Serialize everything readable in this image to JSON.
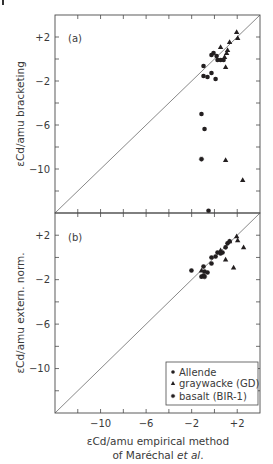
{
  "chart_data": [
    {
      "panel": "(a)",
      "type": "scatter",
      "ylabel": "εCd/amu bracketing",
      "xlabel": "εCd/amu empirical method of Maréchal et al.",
      "xlim": [
        -14,
        4
      ],
      "ylim": [
        -14,
        4
      ],
      "xticks": [
        -10,
        -6,
        -2,
        2
      ],
      "xtick_labels": [
        "−10",
        "−6",
        "−2",
        "+2"
      ],
      "yticks": [
        2,
        -2,
        -6,
        -10
      ],
      "ytick_labels": [
        "+2",
        "−2",
        "−6",
        "−10"
      ],
      "minor_tick_step": 2,
      "reference_line": "1:1",
      "series": [
        {
          "name": "Allende",
          "marker": "circle",
          "x": [
            -0.96,
            -0.96,
            -0.61,
            -0.26,
            0.1,
            -0.26,
            -0.08,
            0.19,
            0.27,
            0.54,
            0.8,
            -1.14,
            -0.87,
            -0.52
          ],
          "y": [
            -0.64,
            -1.55,
            -1.64,
            -1.27,
            -1.82,
            0.36,
            0.55,
            0.27,
            -0.09,
            -0.09,
            -0.09,
            -5.0,
            -6.36,
            -13.8
          ]
        },
        {
          "name": "graywacke (GD)",
          "marker": "triangle",
          "x": [
            1.95,
            2.04,
            1.33,
            0.54,
            0.98,
            0.98,
            2.48,
            1.15,
            1.07,
            0.89
          ],
          "y": [
            2.45,
            1.9,
            1.55,
            1.09,
            -0.73,
            -9.18,
            -11.0,
            0.82,
            0.55,
            0.18
          ]
        },
        {
          "name": "basalt (BIR-1)",
          "marker": "star-dot",
          "x": [
            -1.14
          ],
          "y": [
            -9.1
          ]
        }
      ]
    },
    {
      "panel": "(b)",
      "type": "scatter",
      "ylabel": "εCd/amu extern. norm.",
      "xlabel": "εCd/amu empirical method of Maréchal et al.",
      "xlim": [
        -14,
        4
      ],
      "ylim": [
        -14,
        4
      ],
      "xticks": [
        -10,
        -6,
        -2,
        2
      ],
      "xtick_labels": [
        "−10",
        "−6",
        "−2",
        "+2"
      ],
      "yticks": [
        2,
        -2,
        -6,
        -10
      ],
      "ytick_labels": [
        "+2",
        "−2",
        "−6",
        "−10"
      ],
      "minor_tick_step": 2,
      "reference_line": "1:1",
      "series": [
        {
          "name": "Allende",
          "marker": "circle",
          "x": [
            -2.02,
            -0.96,
            -0.87,
            -0.61,
            -1.14,
            -0.96,
            -0.26,
            -0.26,
            0.1,
            0.27,
            0.54,
            0.71,
            0.98,
            1.15,
            1.33
          ],
          "y": [
            -1.18,
            -0.82,
            -1.27,
            -1.36,
            -1.73,
            -1.64,
            -0.55,
            0.0,
            0.09,
            0.45,
            0.36,
            0.45,
            0.91,
            1.27,
            1.45
          ]
        },
        {
          "name": "graywacke (GD)",
          "marker": "triangle",
          "x": [
            1.95,
            2.04,
            1.33,
            2.56,
            0.98,
            1.68,
            -1.14,
            0.54
          ],
          "y": [
            1.91,
            1.55,
            1.45,
            0.91,
            -0.18,
            -0.91,
            -1.18,
            0.64
          ]
        },
        {
          "name": "basalt (BIR-1)",
          "marker": "star-dot",
          "x": [
            -0.87
          ],
          "y": [
            -1.73
          ]
        }
      ]
    }
  ],
  "figure": {
    "panel_a_tag": "(a)",
    "panel_b_tag": "(b)",
    "ylabel_a": "εCd/amu bracketing",
    "ylabel_b": "εCd/amu extern. norm.",
    "xlabel_line1": "εCd/amu empirical method",
    "xlabel_line2_prefix": "of Maréchal ",
    "xlabel_line2_italic": "et al",
    "xlabel_line2_suffix": ".",
    "legend": [
      {
        "label": "Allende",
        "marker": "circle"
      },
      {
        "label": "graywacke (GD)",
        "marker": "triangle"
      },
      {
        "label": "basalt (BIR-1)",
        "marker": "star-dot"
      }
    ],
    "colors": {
      "ink": "#231f20",
      "axis": "#4a4a4a",
      "text": "#3a3a3a"
    }
  }
}
